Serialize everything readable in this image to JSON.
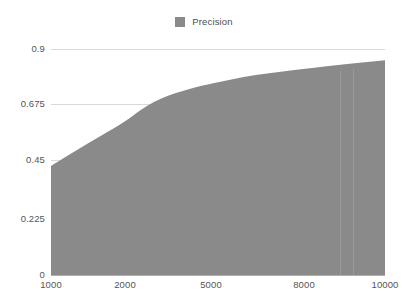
{
  "legend": {
    "position": "top-center",
    "items": [
      {
        "label": "Precision",
        "color": "#8a8a8a",
        "marker": "square-swatch-icon"
      }
    ]
  },
  "axes": {
    "y_ticks": [
      "0.9",
      "0.675",
      "0.45",
      "0.225",
      "0"
    ],
    "x_ticks": [
      "1000",
      "2000",
      "5000",
      "8000",
      "10000"
    ],
    "grid_color": "#d9d9d9",
    "axis_color": "#b0b0b0",
    "tick_label_color": "#555555"
  },
  "chart_data": {
    "type": "area",
    "title": "",
    "subtitle": "",
    "xlabel": "",
    "ylabel": "",
    "xlim": [
      1000,
      10000
    ],
    "ylim": [
      0,
      0.9
    ],
    "x_scale": "piecewise-category",
    "grid": true,
    "grid_axis": "y",
    "legend_position": "top-center",
    "series": [
      {
        "name": "Precision",
        "color": "#8a8a8a",
        "fill": "#8a8a8a",
        "x": [
          1000,
          1500,
          2000,
          2500,
          3000,
          3500,
          4000,
          4500,
          5000,
          6000,
          7000,
          8000,
          9000,
          10000
        ],
        "values": [
          0.434,
          0.525,
          0.61,
          0.655,
          0.69,
          0.714,
          0.733,
          0.749,
          0.762,
          0.788,
          0.806,
          0.82,
          0.84,
          0.855
        ]
      }
    ],
    "annotations": []
  },
  "geometry": {
    "plot_left": 51,
    "plot_top": 49,
    "plot_width": 334,
    "plot_height": 226,
    "x_tick_positions_px": [
      51,
      125,
      211,
      304,
      385
    ],
    "y_tick_positions_px": [
      49,
      104,
      160,
      219,
      275
    ]
  }
}
